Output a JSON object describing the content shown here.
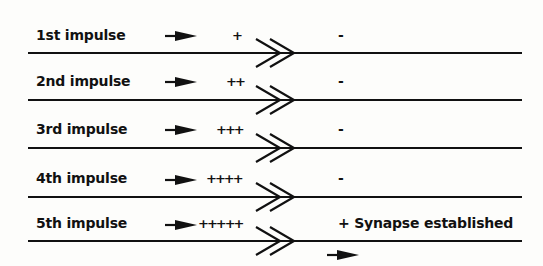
{
  "diagram": {
    "rows": [
      {
        "label": "1st impulse",
        "charges": "+",
        "post_state": "-"
      },
      {
        "label": "2nd impulse",
        "charges": "++",
        "post_state": "-"
      },
      {
        "label": "3rd impulse",
        "charges": "+++",
        "post_state": "-"
      },
      {
        "label": "4th impulse",
        "charges": "++++",
        "post_state": "-"
      },
      {
        "label": "5th impulse",
        "charges": "+++++",
        "post_state": "+ Synapse established"
      }
    ],
    "colors": {
      "ink": "#111111",
      "background": "#fdfdfb"
    }
  }
}
